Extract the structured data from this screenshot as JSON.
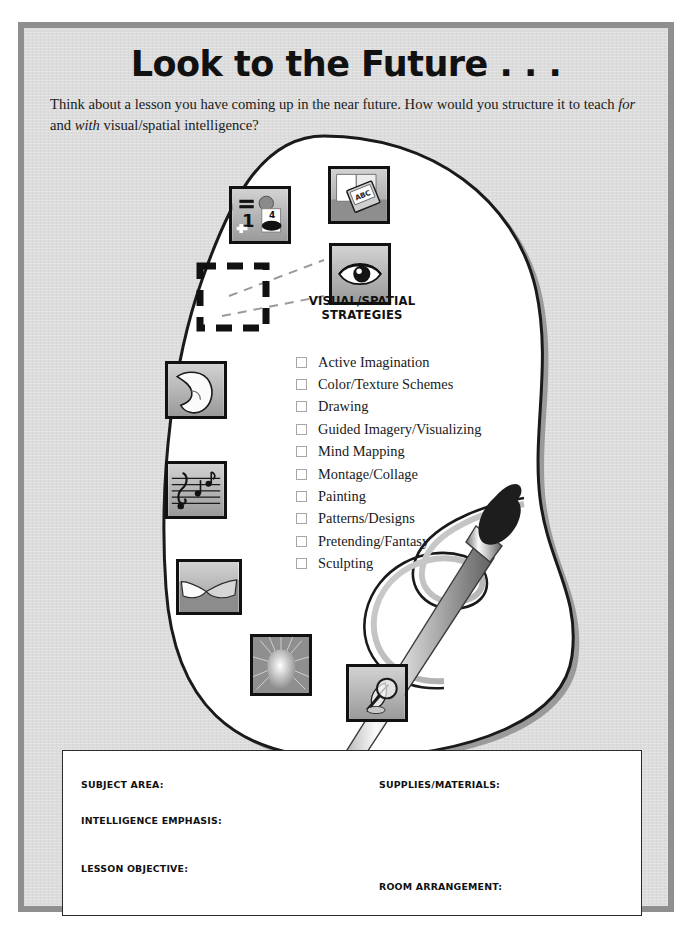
{
  "header": {
    "title": "Look to the Future . . .",
    "intro_before": "Think about a lesson you have coming up in the near future. How would you structure it to teach ",
    "intro_italic_1": "for",
    "intro_middle": " and ",
    "intro_italic_2": "with",
    "intro_after": " visual/spatial intelligence?"
  },
  "strategies": {
    "heading_line1": "VISUAL/SPATIAL",
    "heading_line2": "STRATEGIES",
    "items": [
      "Active Imagination",
      "Color/Texture Schemes",
      "Drawing",
      "Guided Imagery/Visualizing",
      "Mind Mapping",
      "Montage/Collage",
      "Painting",
      "Patterns/Designs",
      "Pretending/Fantasy",
      "Sculpting"
    ]
  },
  "icons": [
    {
      "name": "math-logical-icon",
      "label": "= 1 + 4"
    },
    {
      "name": "book-abc-icon",
      "label": "ABC"
    },
    {
      "name": "eye-visual-icon",
      "label": "eye"
    },
    {
      "name": "empty-slot-placeholder",
      "label": ""
    },
    {
      "name": "flexed-arm-kinesthetic-icon",
      "label": "arm"
    },
    {
      "name": "music-notes-icon",
      "label": "notes"
    },
    {
      "name": "handshake-interpersonal-icon",
      "label": "handshake"
    },
    {
      "name": "glowing-head-intrapersonal-icon",
      "label": "head"
    },
    {
      "name": "magnifier-leaf-naturalist-icon",
      "label": "leaf"
    }
  ],
  "icon_text": {
    "math_equals": "=",
    "math_one": "1",
    "math_four": "4",
    "math_plus": "+",
    "book_abc": "ABC"
  },
  "form": {
    "fields": [
      "SUBJECT AREA:",
      "INTELLIGENCE EMPHASIS:",
      "LESSON OBJECTIVE:",
      "SUPPLIES/MATERIALS:",
      "ROOM ARRANGEMENT:"
    ]
  },
  "colors": {
    "page_bg": "#dcdcdc",
    "page_border": "#8f8f8f",
    "ink": "#111111",
    "palette_fill": "#ffffff",
    "palette_edge": "#8d8d8d",
    "tile_border": "#111111",
    "form_bg": "#ffffff"
  }
}
